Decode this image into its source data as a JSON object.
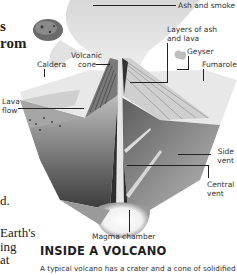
{
  "left_text": {
    "bold_fragments": [
      "s",
      "rom"
    ],
    "body_fragments": [
      "d.",
      "Earth's",
      "ing",
      "at"
    ]
  },
  "diagram": {
    "labels": {
      "ash_and_smoke": "Ash and smoke",
      "layers": [
        "Layers of ash",
        "and lava"
      ],
      "geyser": "Geyser",
      "fumarole": "Fumarole",
      "volcanic_cone": [
        "Volcanic",
        "cone"
      ],
      "caldera": "Caldera",
      "lava_flow": [
        "Lava",
        "flow"
      ],
      "side_vent": [
        "Side",
        "vent"
      ],
      "central_vent": [
        "Central",
        "vent"
      ],
      "magma_chamber": "Magma chamber"
    }
  },
  "section": {
    "heading": "INSIDE A VOLCANO",
    "caption": "A typical volcano has a crater and a cone of solidified"
  }
}
